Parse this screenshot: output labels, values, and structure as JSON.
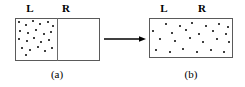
{
  "figure": {
    "type": "free-expansion-diagram",
    "background_color": "#ffffff",
    "line_color": "#5a5a5a",
    "dot_color": "#000000"
  },
  "panel_a": {
    "caption": "(a)",
    "left_label": "L",
    "right_label": "R",
    "divider_present": true,
    "dot_count": 22,
    "dots": [
      {
        "x": 19,
        "y": 22
      },
      {
        "x": 26,
        "y": 25
      },
      {
        "x": 33,
        "y": 21
      },
      {
        "x": 40,
        "y": 24
      },
      {
        "x": 48,
        "y": 22
      },
      {
        "x": 53,
        "y": 26
      },
      {
        "x": 20,
        "y": 31
      },
      {
        "x": 28,
        "y": 33
      },
      {
        "x": 36,
        "y": 30
      },
      {
        "x": 44,
        "y": 34
      },
      {
        "x": 51,
        "y": 32
      },
      {
        "x": 19,
        "y": 39
      },
      {
        "x": 27,
        "y": 41
      },
      {
        "x": 34,
        "y": 38
      },
      {
        "x": 41,
        "y": 42
      },
      {
        "x": 49,
        "y": 40
      },
      {
        "x": 22,
        "y": 48
      },
      {
        "x": 30,
        "y": 50
      },
      {
        "x": 38,
        "y": 47
      },
      {
        "x": 45,
        "y": 51
      },
      {
        "x": 52,
        "y": 48
      },
      {
        "x": 26,
        "y": 55
      }
    ]
  },
  "panel_b": {
    "caption": "(b)",
    "left_label": "L",
    "right_label": "R",
    "divider_present": false,
    "dot_count": 24,
    "dots": [
      {
        "x": 166,
        "y": 24
      },
      {
        "x": 180,
        "y": 26
      },
      {
        "x": 192,
        "y": 23
      },
      {
        "x": 206,
        "y": 26
      },
      {
        "x": 219,
        "y": 24
      },
      {
        "x": 228,
        "y": 27
      },
      {
        "x": 153,
        "y": 31
      },
      {
        "x": 172,
        "y": 33
      },
      {
        "x": 186,
        "y": 30
      },
      {
        "x": 199,
        "y": 34
      },
      {
        "x": 213,
        "y": 31
      },
      {
        "x": 226,
        "y": 34
      },
      {
        "x": 160,
        "y": 39
      },
      {
        "x": 175,
        "y": 41
      },
      {
        "x": 190,
        "y": 38
      },
      {
        "x": 203,
        "y": 42
      },
      {
        "x": 217,
        "y": 39
      },
      {
        "x": 229,
        "y": 42
      },
      {
        "x": 156,
        "y": 50
      },
      {
        "x": 170,
        "y": 52
      },
      {
        "x": 183,
        "y": 49
      },
      {
        "x": 197,
        "y": 52
      },
      {
        "x": 211,
        "y": 50
      },
      {
        "x": 224,
        "y": 52
      }
    ]
  },
  "arrow": {
    "direction": "right",
    "from_panel": "(a)",
    "to_panel": "(b)"
  },
  "layout": {
    "panel_a_letter_l_x": 30,
    "panel_a_letter_r_x": 66,
    "panel_b_letter_l_x": 164,
    "panel_b_letter_r_x": 202,
    "letter_y": 3
  }
}
